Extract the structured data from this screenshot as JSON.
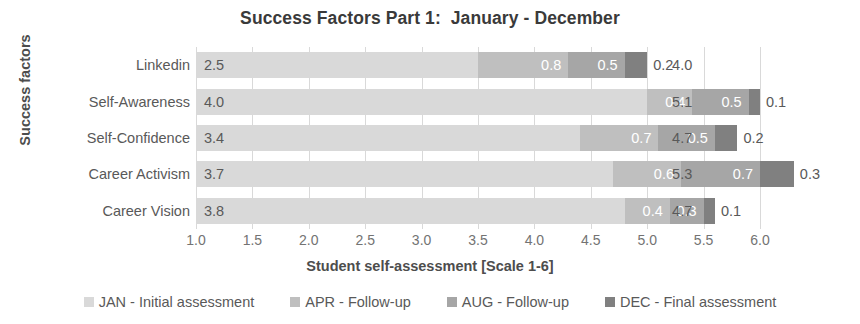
{
  "chart_data": {
    "type": "bar",
    "subtype": "stacked-horizontal",
    "title": "Success Factors Part 1:  January - December",
    "xlabel": "Student self-assessment [Scale 1-6]",
    "ylabel": "Success factors",
    "xlim": [
      1.0,
      6.0
    ],
    "xticks": [
      "1.0",
      "1.5",
      "2.0",
      "2.5",
      "3.0",
      "3.5",
      "4.0",
      "4.5",
      "5.0",
      "5.5",
      "6.0"
    ],
    "xtick_values": [
      1.0,
      1.5,
      2.0,
      2.5,
      3.0,
      3.5,
      4.0,
      4.5,
      5.0,
      5.5,
      6.0
    ],
    "grid": true,
    "grid_axis": "x",
    "legend_position": "bottom",
    "categories": [
      "Linkedin",
      "Self-Awareness",
      "Self-Confidence",
      "Career Activism",
      "Career Vision"
    ],
    "series": [
      {
        "name": "JAN - Initial assessment",
        "color": "#d9d9d9",
        "values": [
          2.5,
          4.0,
          3.4,
          3.7,
          3.8
        ],
        "labels": [
          "2.5",
          "4.0",
          "3.4",
          "3.7",
          "3.8"
        ]
      },
      {
        "name": "APR - Follow-up",
        "color": "#bfbfbf",
        "values": [
          0.8,
          0.4,
          0.7,
          0.6,
          0.4
        ],
        "labels": [
          "0.8",
          "0.4",
          "0.7",
          "0.6",
          "0.4"
        ]
      },
      {
        "name": "AUG - Follow-up",
        "color": "#a6a6a6",
        "values": [
          0.5,
          0.5,
          0.5,
          0.7,
          0.3
        ],
        "labels": [
          "0.5",
          "0.5",
          "0.5",
          "0.7",
          "0.3"
        ]
      },
      {
        "name": "DEC - Final assessment",
        "color": "#808080",
        "values": [
          0.2,
          0.1,
          0.2,
          0.3,
          0.1
        ],
        "labels": [
          "0.2",
          "0.1",
          "0.2",
          "0.3",
          "0.1"
        ]
      }
    ],
    "totals": [
      4.0,
      5.1,
      4.7,
      5.3,
      4.7
    ],
    "total_labels": [
      "4.0",
      "5.1",
      "4.7",
      "5.3",
      "4.7"
    ]
  },
  "legend": {
    "items": [
      {
        "label": "JAN - Initial assessment",
        "color": "#d9d9d9"
      },
      {
        "label": "APR - Follow-up",
        "color": "#bfbfbf"
      },
      {
        "label": "AUG - Follow-up",
        "color": "#a6a6a6"
      },
      {
        "label": "DEC - Final assessment",
        "color": "#808080"
      }
    ]
  },
  "colors": {
    "title_text": "#3a3a3a",
    "axis_text": "#737373",
    "label_text": "#595959",
    "gridline": "#d9d9d9",
    "background": "#ffffff"
  }
}
